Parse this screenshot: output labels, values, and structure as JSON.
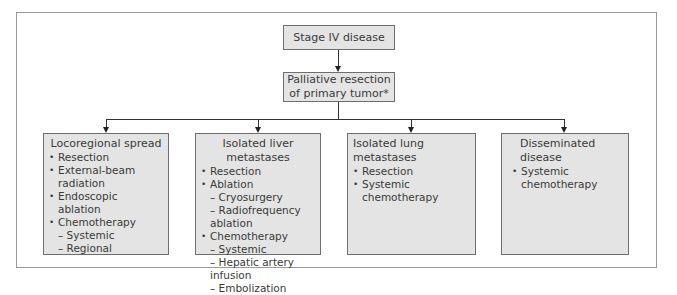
{
  "diagram": {
    "type": "flowchart",
    "root": {
      "label": "Stage IV disease"
    },
    "step": {
      "line1": "Palliative resection",
      "line2": "of primary tumor*"
    },
    "branches": [
      {
        "title": "Locoregional spread",
        "items": [
          {
            "label": "Resection",
            "sub": []
          },
          {
            "label": "External-beam radiation",
            "sub": []
          },
          {
            "label": "Endoscopic ablation",
            "sub": []
          },
          {
            "label": "Chemotherapy",
            "sub": [
              "– Systemic",
              "– Regional"
            ]
          }
        ]
      },
      {
        "title": "Isolated liver metastases",
        "items": [
          {
            "label": "Resection",
            "sub": []
          },
          {
            "label": "Ablation",
            "sub": [
              "– Cryosurgery",
              "– Radiofrequency ablation"
            ]
          },
          {
            "label": "Chemotherapy",
            "sub": [
              "– Systemic",
              "– Hepatic artery infusion",
              "– Embolization"
            ]
          }
        ]
      },
      {
        "title": "Isolated lung metastases",
        "items": [
          {
            "label": "Resection",
            "sub": []
          },
          {
            "label": "Systemic chemotherapy",
            "sub": []
          }
        ]
      },
      {
        "title": "Disseminated disease",
        "items": [
          {
            "label": "Systemic chemotherapy",
            "sub": []
          }
        ]
      }
    ]
  },
  "colors": {
    "box_fill": "#e4e4e4",
    "box_border": "#6e6e6e",
    "frame": "#9a9a9a",
    "connector": "#333333"
  }
}
